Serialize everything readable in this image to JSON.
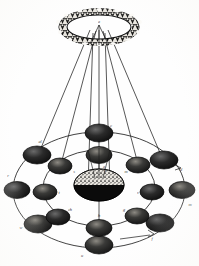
{
  "figure": {
    "background_color": "#fefefe",
    "ink_color": "#1a1a1a",
    "body_fill": "#141414",
    "orbit_stroke": "#2b2b2b"
  },
  "ring_planet": {
    "name": "ring-planet",
    "label": "a",
    "label_x": 99,
    "label_y": 22,
    "center_x": 99,
    "center_y": 27,
    "ring_rx": 40,
    "ring_ry": 18,
    "band_thickness": 5.5,
    "inner_rx": 31,
    "inner_ry": 13
  },
  "central_body": {
    "name": "central-body",
    "label": "b",
    "center_x": 99,
    "center_y": 185,
    "rx": 25,
    "ry": 16,
    "top_fill": "speckled",
    "bottom_fill": "solid-dark"
  },
  "axis": {
    "name": "polar-axis",
    "x": 99,
    "y_top": 30,
    "y_bottom": 250
  },
  "sight_lines": [
    {
      "name": "sight-line-left-outer",
      "x1": 92,
      "y1": 30,
      "x2": 36,
      "y2": 162
    },
    {
      "name": "sight-line-right-outer",
      "x1": 106,
      "y1": 30,
      "x2": 162,
      "y2": 162
    },
    {
      "name": "sight-line-left-inner",
      "x1": 96,
      "y1": 30,
      "x2": 62,
      "y2": 165
    },
    {
      "name": "sight-line-right-inner",
      "x1": 102,
      "y1": 30,
      "x2": 136,
      "y2": 165
    },
    {
      "name": "sight-line-axis",
      "x1": 99,
      "y1": 30,
      "x2": 99,
      "y2": 185
    }
  ],
  "cone_lines": [
    {
      "name": "cone-line-left",
      "x1": 99,
      "y1": 26,
      "x2": 83,
      "y2": 48
    },
    {
      "name": "cone-line-right",
      "x1": 99,
      "y1": 26,
      "x2": 112,
      "y2": 48
    },
    {
      "name": "cone-line-mid",
      "x1": 99,
      "y1": 26,
      "x2": 99,
      "y2": 50
    }
  ],
  "orbits": [
    {
      "name": "outer-orbit",
      "center_x": 99,
      "center_y": 190,
      "rx": 86,
      "ry": 58,
      "satellite_count": 8
    },
    {
      "name": "inner-orbit",
      "center_x": 99,
      "center_y": 188,
      "rx": 56,
      "ry": 38,
      "satellite_count": 8
    }
  ],
  "outer_satellites": [
    {
      "name": "outer-satellite-1",
      "label": "d",
      "cx": 164,
      "cy": 160,
      "rx": 14,
      "ry": 9,
      "label_x": 181,
      "label_y": 170
    },
    {
      "name": "outer-satellite-2",
      "label": "m",
      "cx": 183,
      "cy": 190,
      "rx": 13,
      "ry": 8.5,
      "label_x": 189,
      "label_y": 205
    },
    {
      "name": "outer-satellite-3",
      "label": "f",
      "cx": 160,
      "cy": 223,
      "rx": 14,
      "ry": 9,
      "label_x": 152,
      "label_y": 237
    },
    {
      "name": "outer-satellite-4",
      "label": "u",
      "cx": 99,
      "cy": 245,
      "rx": 14,
      "ry": 9,
      "label_x": 82,
      "label_y": 254
    },
    {
      "name": "outer-satellite-5",
      "label": "w",
      "cx": 38,
      "cy": 225,
      "rx": 14,
      "ry": 9,
      "label_x": 22,
      "label_y": 228
    },
    {
      "name": "outer-satellite-6",
      "label": "r",
      "cx": 16,
      "cy": 190,
      "rx": 13,
      "ry": 8.5,
      "label_x": 10,
      "label_y": 176
    },
    {
      "name": "outer-satellite-7",
      "label": "al",
      "cx": 37,
      "cy": 155,
      "rx": 14,
      "ry": 9,
      "label_x": 40,
      "label_y": 142
    },
    {
      "name": "outer-satellite-8",
      "label": "c",
      "cx": 99,
      "cy": 133,
      "rx": 14,
      "ry": 9,
      "label_x": 110,
      "label_y": 126
    }
  ],
  "inner_satellites": [
    {
      "name": "inner-satellite-1",
      "label": "m",
      "cx": 138,
      "cy": 165,
      "rx": 12,
      "ry": 8,
      "label_x": 126,
      "label_y": 172
    },
    {
      "name": "inner-satellite-2",
      "label": "v",
      "cx": 153,
      "cy": 192,
      "rx": 12,
      "ry": 8,
      "label_x": 138,
      "label_y": 193
    },
    {
      "name": "inner-satellite-3",
      "label": "g",
      "cx": 137,
      "cy": 216,
      "rx": 12,
      "ry": 8,
      "label_x": 124,
      "label_y": 211
    },
    {
      "name": "inner-satellite-4",
      "label": "h",
      "cx": 99,
      "cy": 228,
      "rx": 13,
      "ry": 8.5,
      "label_x": 99,
      "label_y": 216
    },
    {
      "name": "inner-satellite-5",
      "label": "ch",
      "cx": 58,
      "cy": 217,
      "rx": 12,
      "ry": 8,
      "label_x": 70,
      "label_y": 210
    },
    {
      "name": "inner-satellite-6",
      "label": "t",
      "cx": 44,
      "cy": 192,
      "rx": 12,
      "ry": 8,
      "label_x": 59,
      "label_y": 193
    },
    {
      "name": "inner-satellite-7",
      "label": "s",
      "cx": 60,
      "cy": 166,
      "rx": 12,
      "ry": 8,
      "label_x": 74,
      "label_y": 172
    },
    {
      "name": "inner-satellite-8",
      "label": "q",
      "cx": 99,
      "cy": 155,
      "rx": 13,
      "ry": 8.5,
      "label_x": 103,
      "label_y": 167
    }
  ],
  "extra_labels": [
    {
      "name": "label-apex",
      "text": "k",
      "x": 99,
      "y": 22
    }
  ]
}
